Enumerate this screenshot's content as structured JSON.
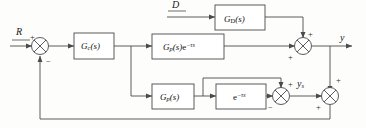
{
  "diagram": {
    "type": "control-block-diagram",
    "line_color": "#4a4a4a",
    "text_color": "#111111",
    "background": "#fdfdfc"
  },
  "signals": {
    "reference": "R",
    "disturbance": "D",
    "output": "y",
    "predictor_output_y": "y",
    "predictor_output_sub": "s"
  },
  "blocks": [
    {
      "id": "controller",
      "main": "G",
      "sub": "c",
      "arg": "(s)",
      "exp": "",
      "label": "Gc(s)"
    },
    {
      "id": "disturbance-transfer",
      "main": "G",
      "sub": "D",
      "arg": "(s)",
      "exp": "",
      "label": "GD(s)"
    },
    {
      "id": "plant-with-delay",
      "main": "G",
      "sub": "p",
      "arg": "(s)",
      "exp": "e",
      "exp_pow": "−τs",
      "label": "Gp(s)e^-ts"
    },
    {
      "id": "plant-model",
      "main": "G",
      "sub": "p",
      "arg": "(s)",
      "exp": "",
      "label": "Gp(s)"
    },
    {
      "id": "delay-model",
      "main": "e",
      "sub": "",
      "arg": "",
      "exp_pow": "−τs",
      "label": "e^-ts"
    }
  ],
  "summers": [
    {
      "id": "error-summer",
      "signs": {
        "left": "+",
        "bottom": "−"
      }
    },
    {
      "id": "output-summer",
      "signs": {
        "top": "+",
        "bottom": "+"
      }
    },
    {
      "id": "predictor-summer",
      "signs": {
        "top": "+",
        "bottom": "−"
      }
    },
    {
      "id": "feedback-summer",
      "signs": {
        "top": "+",
        "bottom": "+"
      }
    }
  ],
  "signs": {
    "plus": "+",
    "minus": "−"
  }
}
